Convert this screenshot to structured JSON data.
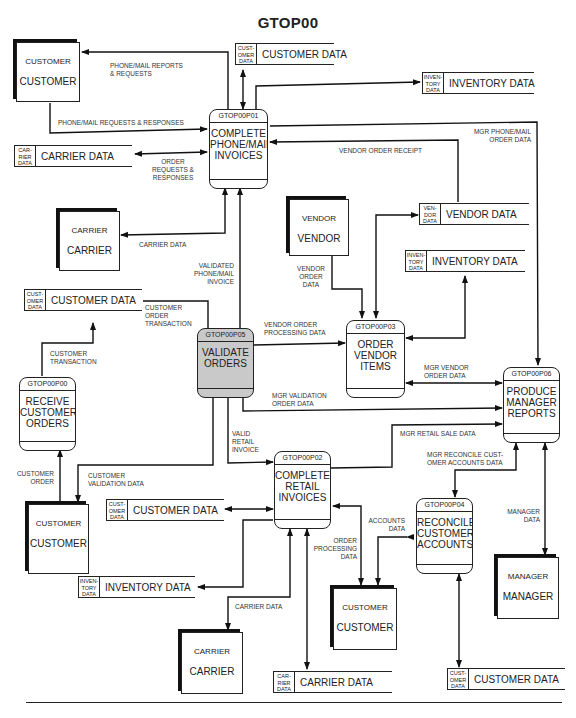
{
  "title": "GTOP00",
  "entities": [
    {
      "id": "customer_top",
      "small": "CUSTOMER",
      "large": "CUSTOMER"
    },
    {
      "id": "carrier_top",
      "small": "CARRIER",
      "large": "CARRIER"
    },
    {
      "id": "vendor",
      "small": "VENDOR",
      "large": "VENDOR"
    },
    {
      "id": "customer_bottom_left",
      "small": "CUSTOMER",
      "large": "CUSTOMER"
    },
    {
      "id": "customer_bottom_mid",
      "small": "CUSTOMER",
      "large": "CUSTOMER"
    },
    {
      "id": "carrier_bottom",
      "small": "CARRIER",
      "large": "CARRIER"
    },
    {
      "id": "manager",
      "small": "MANAGER",
      "large": "MANAGER"
    }
  ],
  "processes": [
    {
      "id": "GTOP00P01",
      "name": "COMPLETE PHONE/MAIL INVOICES"
    },
    {
      "id": "GTOP00P05",
      "name": "VALIDATE ORDERS",
      "highlighted": true
    },
    {
      "id": "GTOP00P00",
      "name": "RECEIVE CUSTOMER ORDERS"
    },
    {
      "id": "GTOP00P03",
      "name": "ORDER VENDOR ITEMS"
    },
    {
      "id": "GTOP00P06",
      "name": "PRODUCE MANAGER REPORTS"
    },
    {
      "id": "GTOP00P02",
      "name": "COMPLETE RETAIL INVOICES"
    },
    {
      "id": "GTOP00P04",
      "name": "RECONCILE CUSTOMER ACCOUNTS"
    }
  ],
  "stores": [
    {
      "tag": "CUST- OMER DATA",
      "name": "CUSTOMER DATA"
    },
    {
      "tag": "INVEN- TORY DATA",
      "name": "INVENTORY DATA"
    },
    {
      "tag": "CAR- RIER DATA",
      "name": "CARRIER DATA"
    },
    {
      "tag": "VEN- DOR DATA",
      "name": "VENDOR DATA"
    },
    {
      "tag": "INVEN- TORY DATA",
      "name": "INVENTORY DATA"
    },
    {
      "tag": "CUST- OMER DATA",
      "name": "CUSTOMER DATA"
    },
    {
      "tag": "CUST- OMER DATA",
      "name": "CUSTOMER DATA"
    },
    {
      "tag": "INVEN- TORY DATA",
      "name": "INVENTORY DATA"
    },
    {
      "tag": "CAR- RIER DATA",
      "name": "CARRIER DATA"
    },
    {
      "tag": "CUST- OMER DATA",
      "name": "CUSTOMER DATA"
    }
  ],
  "flows": [
    "PHONE/MAIL REPORTS & REQUESTS",
    "PHONE/MAIL REQUESTS & RESPONSES",
    "ORDER REQUESTS & RESPONSES",
    "CARRIER DATA",
    "VALIDATED PHONE/MAIL INVOICE",
    "CUSTOMER ORDER TRANSACTION",
    "CUSTOMER TRANSACTION",
    "VENDOR ORDER RECEIPT",
    "MGR PHONE/MAIL ORDER DATA",
    "VENDOR ORDER DATA",
    "VENDOR ORDER PROCESSING DATA",
    "MGR VENDOR ORDER DATA",
    "MGR VALIDATION ORDER DATA",
    "VALID RETAIL INVOICE",
    "MGR RETAIL SALE DATA",
    "MGR RECONCILE CUST- OMER ACCOUNTS DATA",
    "CUSTOMER ORDER",
    "CUSTOMER VALIDATION DATA",
    "ACCOUNTS DATA",
    "ORDER PROCESSING DATA",
    "MANAGER DATA",
    "CARRIER DATA"
  ]
}
